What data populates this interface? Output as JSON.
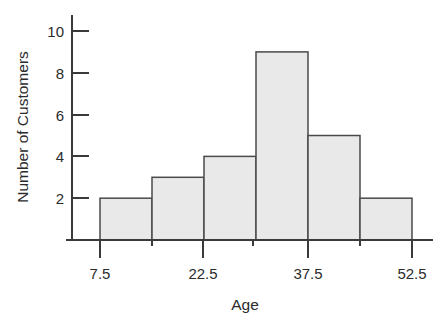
{
  "chart_data": {
    "type": "bar",
    "title": "",
    "xlabel": "Age",
    "ylabel": "Number of Customers",
    "categories": [
      "7.5-15",
      "15-22.5",
      "22.5-30",
      "30-37.5",
      "37.5-45",
      "45-52.5"
    ],
    "bin_edges": [
      7.5,
      15,
      22.5,
      30,
      37.5,
      45,
      52.5
    ],
    "values": [
      2,
      3,
      4,
      9,
      5,
      2
    ],
    "bars": [
      {
        "label": "7.5-15",
        "x0": 7.5,
        "x1": 15,
        "value": 2
      },
      {
        "label": "15-22.5",
        "x0": 15,
        "x1": 22.5,
        "value": 3
      },
      {
        "label": "22.5-30",
        "x0": 22.5,
        "x1": 30,
        "value": 4
      },
      {
        "label": "30-37.5",
        "x0": 30,
        "x1": 37.5,
        "value": 9
      },
      {
        "label": "37.5-45",
        "x0": 37.5,
        "x1": 45,
        "value": 5
      },
      {
        "label": "45-52.5",
        "x0": 45,
        "x1": 52.5,
        "value": 2
      }
    ],
    "xlim": [
      7.5,
      52.5
    ],
    "ylim": [
      0,
      10
    ],
    "xticks": [
      7.5,
      15,
      22.5,
      30,
      37.5,
      45,
      52.5
    ],
    "xtick_labels": [
      "7.5",
      "",
      "22.5",
      "",
      "37.5",
      "",
      "52.5"
    ],
    "yticks": [
      2,
      4,
      6,
      8,
      10
    ],
    "ytick_labels": [
      "2",
      "4",
      "6",
      "8",
      "10"
    ],
    "grid": false,
    "legend": "none",
    "bar_fill": "#e9e9e9",
    "bar_edge": "#4a4a4a",
    "axis_color": "#3a3a3a"
  },
  "axis": {
    "y_label": "Number of Customers",
    "x_label": "Age",
    "y_ticks": [
      "2",
      "4",
      "6",
      "8",
      "10"
    ],
    "x_ticks": [
      "7.5",
      "22.5",
      "37.5",
      "52.5"
    ]
  }
}
